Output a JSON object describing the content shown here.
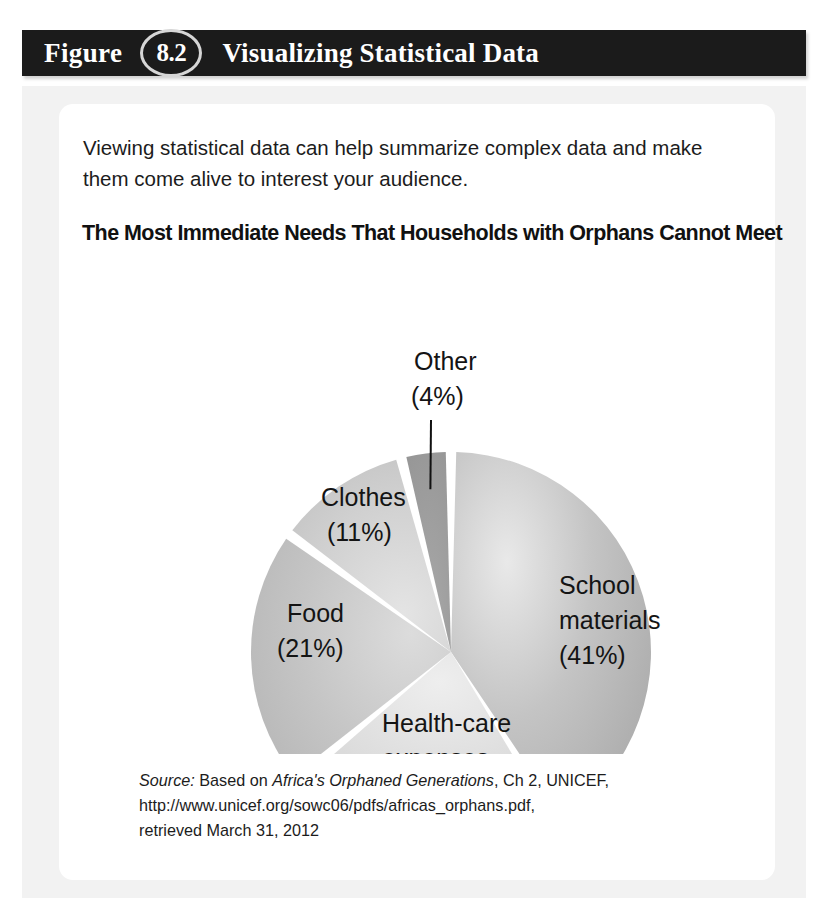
{
  "header": {
    "figure_word": "Figure",
    "figure_number": "8.2",
    "title": "Visualizing Statistical Data"
  },
  "body": {
    "intro_text": "Viewing statistical data can help summarize complex data and make them come alive to interest your audience.",
    "chart_title": "The Most Immediate Needs That Households with Orphans Cannot Meet"
  },
  "source": {
    "label": "Source:",
    "based_on": "Based on",
    "work_title": "Africa's Orphaned Generations",
    "chapter": ", Ch 2, UNICEF,",
    "url": "http://www.unicef.org/sowc06/pdfs/africas_orphans.pdf,",
    "retrieved": "retrieved March 31, 2012"
  },
  "chart_data": {
    "type": "pie",
    "title": "The Most Immediate Needs That Households with Orphans Cannot Meet",
    "categories": [
      "School materials",
      "Health-care expenses",
      "Food",
      "Clothes",
      "Other"
    ],
    "values": [
      41,
      23,
      21,
      11,
      4
    ],
    "unit": "%",
    "legend": "none",
    "labels_inline": true,
    "slices": [
      {
        "name": "School materials",
        "value": 41,
        "label_line1": "School",
        "label_line2": "materials",
        "label_line3": "(41%)",
        "label_x": 500,
        "label_y": 340,
        "fill": "#b5b5b5",
        "start_angle": 0,
        "end_angle": 147.6,
        "leader": false
      },
      {
        "name": "Health-care expenses",
        "value": 23,
        "label_line1": "Health-care",
        "label_line2": "expenses",
        "label_line3": "(23%)",
        "label_x": 323,
        "label_y": 478,
        "fill": "#d2d2d2",
        "start_angle": 147.6,
        "end_angle": 230.4,
        "leader": false
      },
      {
        "name": "Food",
        "value": 21,
        "label_line1": "Food",
        "label_line2": "(21%)",
        "label_line3": "",
        "label_x": 228,
        "label_y": 368,
        "fill": "#c2c2c2",
        "start_angle": 230.4,
        "end_angle": 306.0,
        "leader": false
      },
      {
        "name": "Clothes",
        "value": 11,
        "label_line1": "Clothes",
        "label_line2": "(11%)",
        "label_line3": "",
        "label_x": 262,
        "label_y": 252,
        "fill": "#cfcfcf",
        "start_angle": 306.0,
        "end_angle": 345.6,
        "leader": false
      },
      {
        "name": "Other",
        "value": 4,
        "label_line1": "Other",
        "label_line2": "(4%)",
        "label_line3": "",
        "label_x": 355,
        "label_y": 116,
        "fill": "#9a9a9a",
        "start_angle": 345.6,
        "end_angle": 360.0,
        "leader": true
      }
    ]
  }
}
